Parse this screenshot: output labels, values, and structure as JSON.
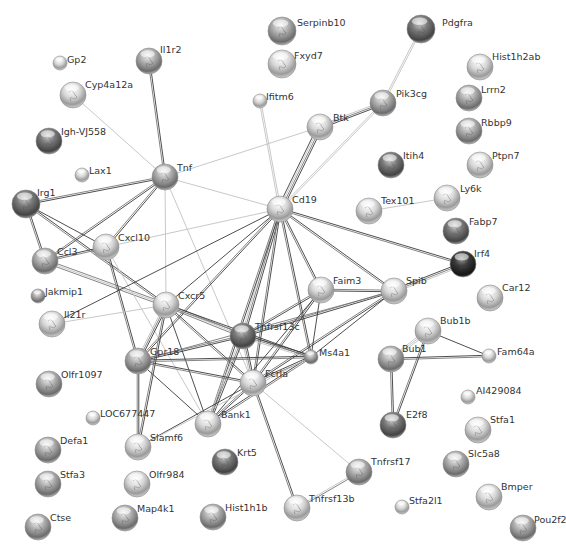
{
  "network": {
    "title": "Protein interaction network",
    "colors": {
      "background": "#ffffff",
      "edge_dark": "#3a3a3a",
      "edge_mid": "#777777",
      "edge_light": "#c2c2c2",
      "node_light": "#e4e4e4",
      "node_mid": "#a8a8a8",
      "node_dark": "#5a5a5a",
      "label": "#333333"
    },
    "nodes": [
      {
        "id": "Serpinb10",
        "label": "Serpinb10",
        "x": 282,
        "y": 31,
        "r": 14,
        "shade": "mid",
        "lx": 297,
        "ly": 22
      },
      {
        "id": "Fxyd7",
        "label": "Fxyd7",
        "x": 282,
        "y": 64,
        "r": 14,
        "shade": "light",
        "lx": 294,
        "ly": 55
      },
      {
        "id": "Pdgfra",
        "label": "Pdgfra",
        "x": 421,
        "y": 29,
        "r": 14,
        "shade": "dark",
        "lx": 442,
        "ly": 22
      },
      {
        "id": "Il1r2",
        "label": "Il1r2",
        "x": 149,
        "y": 61,
        "r": 13,
        "shade": "mid",
        "lx": 160,
        "ly": 49
      },
      {
        "id": "Gp2",
        "label": "Gp2",
        "x": 60,
        "y": 63,
        "r": 7,
        "shade": "light",
        "lx": 67,
        "ly": 59
      },
      {
        "id": "Cyp4a12a",
        "label": "Cyp4a12a",
        "x": 73,
        "y": 95,
        "r": 13,
        "shade": "light",
        "lx": 85,
        "ly": 84
      },
      {
        "id": "Ifitm6",
        "label": "Ifitm6",
        "x": 260,
        "y": 101,
        "r": 7,
        "shade": "light",
        "lx": 266,
        "ly": 96
      },
      {
        "id": "Hist1h2ab",
        "label": "Hist1h2ab",
        "x": 480,
        "y": 67,
        "r": 13,
        "shade": "light",
        "lx": 492,
        "ly": 56
      },
      {
        "id": "Lrrn2",
        "label": "Lrrn2",
        "x": 469,
        "y": 98,
        "r": 13,
        "shade": "mid",
        "lx": 481,
        "ly": 89
      },
      {
        "id": "Rbbp9",
        "label": "Rbbp9",
        "x": 469,
        "y": 131,
        "r": 13,
        "shade": "mid",
        "lx": 481,
        "ly": 122
      },
      {
        "id": "Ptpn7",
        "label": "Ptpn7",
        "x": 480,
        "y": 165,
        "r": 13,
        "shade": "light",
        "lx": 492,
        "ly": 155
      },
      {
        "id": "Pik3cg",
        "label": "Pik3cg",
        "x": 383,
        "y": 103,
        "r": 13,
        "shade": "mid",
        "lx": 396,
        "ly": 93
      },
      {
        "id": "Btk",
        "label": "Btk",
        "x": 320,
        "y": 127,
        "r": 13,
        "shade": "light",
        "lx": 333,
        "ly": 117
      },
      {
        "id": "Igh-VJ558",
        "label": "Igh-VJ558",
        "x": 49,
        "y": 141,
        "r": 13,
        "shade": "dark",
        "lx": 61,
        "ly": 131
      },
      {
        "id": "Lax1",
        "label": "Lax1",
        "x": 82,
        "y": 175,
        "r": 7,
        "shade": "light",
        "lx": 89,
        "ly": 170
      },
      {
        "id": "Tnf",
        "label": "Tnf",
        "x": 165,
        "y": 177,
        "r": 13,
        "shade": "mid",
        "lx": 177,
        "ly": 167
      },
      {
        "id": "Itih4",
        "label": "Itih4",
        "x": 391,
        "y": 165,
        "r": 13,
        "shade": "dark",
        "lx": 403,
        "ly": 155
      },
      {
        "id": "Irg1",
        "label": "Irg1",
        "x": 26,
        "y": 204,
        "r": 14,
        "shade": "dark",
        "lx": 37,
        "ly": 192
      },
      {
        "id": "Cd19",
        "label": "Cd19",
        "x": 280,
        "y": 209,
        "r": 13,
        "shade": "light",
        "lx": 292,
        "ly": 199
      },
      {
        "id": "Tex101",
        "label": "Tex101",
        "x": 369,
        "y": 211,
        "r": 13,
        "shade": "light",
        "lx": 381,
        "ly": 200
      },
      {
        "id": "Ly6k",
        "label": "Ly6k",
        "x": 447,
        "y": 198,
        "r": 13,
        "shade": "light",
        "lx": 460,
        "ly": 188
      },
      {
        "id": "Fabp7",
        "label": "Fabp7",
        "x": 456,
        "y": 231,
        "r": 13,
        "shade": "dark",
        "lx": 469,
        "ly": 221
      },
      {
        "id": "Irf4",
        "label": "Irf4",
        "x": 463,
        "y": 264,
        "r": 13,
        "shade": "black",
        "lx": 474,
        "ly": 253
      },
      {
        "id": "Cxcl10",
        "label": "Cxcl10",
        "x": 106,
        "y": 247,
        "r": 13,
        "shade": "light",
        "lx": 118,
        "ly": 237
      },
      {
        "id": "Ccl3",
        "label": "Ccl3",
        "x": 45,
        "y": 261,
        "r": 13,
        "shade": "mid",
        "lx": 57,
        "ly": 251
      },
      {
        "id": "Jakmip1",
        "label": "Jakmip1",
        "x": 38,
        "y": 296,
        "r": 7,
        "shade": "mid",
        "lx": 45,
        "ly": 291
      },
      {
        "id": "Faim3",
        "label": "Faim3",
        "x": 321,
        "y": 290,
        "r": 13,
        "shade": "light",
        "lx": 333,
        "ly": 280
      },
      {
        "id": "Spib",
        "label": "Spib",
        "x": 394,
        "y": 291,
        "r": 13,
        "shade": "light",
        "lx": 406,
        "ly": 280
      },
      {
        "id": "Car12",
        "label": "Car12",
        "x": 490,
        "y": 298,
        "r": 13,
        "shade": "light",
        "lx": 502,
        "ly": 287
      },
      {
        "id": "Cxcr5",
        "label": "Cxcr5",
        "x": 166,
        "y": 305,
        "r": 13,
        "shade": "light",
        "lx": 178,
        "ly": 295
      },
      {
        "id": "Il21r",
        "label": "Il21r",
        "x": 52,
        "y": 324,
        "r": 13,
        "shade": "light",
        "lx": 64,
        "ly": 314
      },
      {
        "id": "Tnfrsf13c",
        "label": "Tnfrsf13c",
        "x": 243,
        "y": 336,
        "r": 13,
        "shade": "dark",
        "lx": 255,
        "ly": 326
      },
      {
        "id": "Bub1b",
        "label": "Bub1b",
        "x": 428,
        "y": 331,
        "r": 13,
        "shade": "light",
        "lx": 440,
        "ly": 320
      },
      {
        "id": "Gpr18",
        "label": "Gpr18",
        "x": 138,
        "y": 361,
        "r": 13,
        "shade": "mid",
        "lx": 150,
        "ly": 351
      },
      {
        "id": "Ms4a1",
        "label": "Ms4a1",
        "x": 311,
        "y": 357,
        "r": 7,
        "shade": "mid",
        "lx": 319,
        "ly": 352
      },
      {
        "id": "Bub1",
        "label": "Bub1",
        "x": 391,
        "y": 359,
        "r": 13,
        "shade": "mid",
        "lx": 402,
        "ly": 348
      },
      {
        "id": "Fam64a",
        "label": "Fam64a",
        "x": 489,
        "y": 356,
        "r": 7,
        "shade": "light",
        "lx": 497,
        "ly": 351
      },
      {
        "id": "Fcrla",
        "label": "Fcrla",
        "x": 253,
        "y": 383,
        "r": 13,
        "shade": "light",
        "lx": 265,
        "ly": 373
      },
      {
        "id": "Olfr1097",
        "label": "Olfr1097",
        "x": 49,
        "y": 384,
        "r": 13,
        "shade": "mid",
        "lx": 61,
        "ly": 374
      },
      {
        "id": "AI429084",
        "label": "AI429084",
        "x": 468,
        "y": 397,
        "r": 7,
        "shade": "light",
        "lx": 476,
        "ly": 390
      },
      {
        "id": "LOC677447",
        "label": "LOC677447",
        "x": 93,
        "y": 418,
        "r": 7,
        "shade": "light",
        "lx": 100,
        "ly": 413
      },
      {
        "id": "Bank1",
        "label": "Bank1",
        "x": 208,
        "y": 424,
        "r": 13,
        "shade": "light",
        "lx": 221,
        "ly": 414
      },
      {
        "id": "E2f8",
        "label": "E2f8",
        "x": 393,
        "y": 425,
        "r": 13,
        "shade": "dark",
        "lx": 406,
        "ly": 414
      },
      {
        "id": "Stfa1",
        "label": "Stfa1",
        "x": 478,
        "y": 430,
        "r": 13,
        "shade": "light",
        "lx": 490,
        "ly": 419
      },
      {
        "id": "Defa1",
        "label": "Defa1",
        "x": 48,
        "y": 450,
        "r": 13,
        "shade": "mid",
        "lx": 60,
        "ly": 440
      },
      {
        "id": "Slamf6",
        "label": "Slamf6",
        "x": 138,
        "y": 447,
        "r": 13,
        "shade": "light",
        "lx": 150,
        "ly": 437
      },
      {
        "id": "Slc5a8",
        "label": "Slc5a8",
        "x": 456,
        "y": 464,
        "r": 13,
        "shade": "mid",
        "lx": 468,
        "ly": 453
      },
      {
        "id": "Tnfrsf17",
        "label": "Tnfrsf17",
        "x": 359,
        "y": 472,
        "r": 13,
        "shade": "mid",
        "lx": 371,
        "ly": 461
      },
      {
        "id": "Krt5",
        "label": "Krt5",
        "x": 225,
        "y": 462,
        "r": 13,
        "shade": "dark",
        "lx": 237,
        "ly": 452
      },
      {
        "id": "Stfa3",
        "label": "Stfa3",
        "x": 48,
        "y": 484,
        "r": 13,
        "shade": "mid",
        "lx": 60,
        "ly": 474
      },
      {
        "id": "Olfr984",
        "label": "Olfr984",
        "x": 137,
        "y": 484,
        "r": 13,
        "shade": "light",
        "lx": 149,
        "ly": 474
      },
      {
        "id": "Bmper",
        "label": "Bmper",
        "x": 489,
        "y": 497,
        "r": 13,
        "shade": "light",
        "lx": 501,
        "ly": 486
      },
      {
        "id": "Tnfrsf13b",
        "label": "Tnfrsf13b",
        "x": 297,
        "y": 508,
        "r": 13,
        "shade": "light",
        "lx": 309,
        "ly": 498
      },
      {
        "id": "Stfa2l1",
        "label": "Stfa2l1",
        "x": 402,
        "y": 507,
        "r": 7,
        "shade": "light",
        "lx": 409,
        "ly": 500
      },
      {
        "id": "Map4k1",
        "label": "Map4k1",
        "x": 125,
        "y": 518,
        "r": 13,
        "shade": "mid",
        "lx": 137,
        "ly": 508
      },
      {
        "id": "Hist1h1b",
        "label": "Hist1h1b",
        "x": 213,
        "y": 517,
        "r": 13,
        "shade": "mid",
        "lx": 225,
        "ly": 507
      },
      {
        "id": "Ctse",
        "label": "Ctse",
        "x": 38,
        "y": 527,
        "r": 13,
        "shade": "mid",
        "lx": 50,
        "ly": 517
      },
      {
        "id": "Pou2f2",
        "label": "Pou2f2",
        "x": 523,
        "y": 528,
        "r": 13,
        "shade": "mid",
        "lx": 534,
        "ly": 519
      }
    ],
    "edges": [
      [
        "Pdgfra",
        "Pik3cg",
        "light",
        2
      ],
      [
        "Pik3cg",
        "Btk",
        "dark",
        3
      ],
      [
        "Pik3cg",
        "Cd19",
        "light",
        2
      ],
      [
        "Btk",
        "Cd19",
        "dark",
        4
      ],
      [
        "Btk",
        "Tnf",
        "light",
        1
      ],
      [
        "Il1r2",
        "Tnf",
        "dark",
        2
      ],
      [
        "Cyp4a12a",
        "Tnf",
        "light",
        1
      ],
      [
        "Ifitm6",
        "Cd19",
        "light",
        2
      ],
      [
        "Tnf",
        "Irg1",
        "dark",
        2
      ],
      [
        "Tnf",
        "Cxcl10",
        "dark",
        2
      ],
      [
        "Tnf",
        "Ccl3",
        "dark",
        2
      ],
      [
        "Tnf",
        "Cd19",
        "light",
        1
      ],
      [
        "Tnf",
        "Cxcr5",
        "light",
        1
      ],
      [
        "Tnf",
        "Fcrla",
        "light",
        1
      ],
      [
        "Irg1",
        "Ccl3",
        "dark",
        2
      ],
      [
        "Irg1",
        "Cxcl10",
        "dark",
        1
      ],
      [
        "Irg1",
        "Cxcr5",
        "dark",
        2
      ],
      [
        "Ccl3",
        "Cxcl10",
        "dark",
        2
      ],
      [
        "Ccl3",
        "Cxcr5",
        "mid",
        3
      ],
      [
        "Cxcl10",
        "Cd19",
        "light",
        1
      ],
      [
        "Cxcl10",
        "Gpr18",
        "dark",
        2
      ],
      [
        "Cxcl10",
        "Bank1",
        "light",
        1
      ],
      [
        "Il21r",
        "Cd19",
        "dark",
        1
      ],
      [
        "Il21r",
        "Cxcr5",
        "light",
        1
      ],
      [
        "Cd19",
        "Cxcr5",
        "dark",
        1
      ],
      [
        "Cd19",
        "Tnfrsf13c",
        "dark",
        3
      ],
      [
        "Cd19",
        "Faim3",
        "dark",
        2
      ],
      [
        "Cd19",
        "Spib",
        "dark",
        2
      ],
      [
        "Cd19",
        "Irf4",
        "dark",
        2
      ],
      [
        "Cd19",
        "Fcrla",
        "dark",
        2
      ],
      [
        "Cd19",
        "Ms4a1",
        "dark",
        2
      ],
      [
        "Cd19",
        "Gpr18",
        "dark",
        2
      ],
      [
        "Cd19",
        "Bank1",
        "dark",
        2
      ],
      [
        "Tex101",
        "Ly6k",
        "light",
        1
      ],
      [
        "Spib",
        "Irf4",
        "dark",
        3
      ],
      [
        "Spib",
        "Faim3",
        "dark",
        2
      ],
      [
        "Spib",
        "Tnfrsf13c",
        "dark",
        2
      ],
      [
        "Spib",
        "Fcrla",
        "dark",
        2
      ],
      [
        "Spib",
        "Gpr18",
        "mid",
        1
      ],
      [
        "Spib",
        "Ms4a1",
        "dark",
        1
      ],
      [
        "Faim3",
        "Tnfrsf13c",
        "dark",
        2
      ],
      [
        "Faim3",
        "Fcrla",
        "dark",
        2
      ],
      [
        "Faim3",
        "Ms4a1",
        "dark",
        1
      ],
      [
        "Faim3",
        "Bank1",
        "dark",
        1
      ],
      [
        "Cxcr5",
        "Tnfrsf13c",
        "mid",
        3
      ],
      [
        "Cxcr5",
        "Gpr18",
        "dark",
        3
      ],
      [
        "Cxcr5",
        "Fcrla",
        "dark",
        2
      ],
      [
        "Cxcr5",
        "Bank1",
        "dark",
        1
      ],
      [
        "Cxcr5",
        "Slamf6",
        "dark",
        2
      ],
      [
        "Cxcr5",
        "Ms4a1",
        "dark",
        2
      ],
      [
        "Tnfrsf13c",
        "Gpr18",
        "dark",
        2
      ],
      [
        "Tnfrsf13c",
        "Fcrla",
        "dark",
        3
      ],
      [
        "Tnfrsf13c",
        "Ms4a1",
        "dark",
        3
      ],
      [
        "Tnfrsf13c",
        "Bank1",
        "dark",
        3
      ],
      [
        "Gpr18",
        "Fcrla",
        "dark",
        2
      ],
      [
        "Gpr18",
        "Ms4a1",
        "dark",
        2
      ],
      [
        "Gpr18",
        "Bank1",
        "dark",
        1
      ],
      [
        "Gpr18",
        "Slamf6",
        "dark",
        2
      ],
      [
        "Fcrla",
        "Ms4a1",
        "dark",
        2
      ],
      [
        "Fcrla",
        "Bank1",
        "dark",
        2
      ],
      [
        "Fcrla",
        "Slamf6",
        "dark",
        1
      ],
      [
        "Fcrla",
        "Tnfrsf13b",
        "dark",
        2
      ],
      [
        "Fcrla",
        "Tnfrsf17",
        "light",
        1
      ],
      [
        "Bank1",
        "Ms4a1",
        "dark",
        2
      ],
      [
        "Slamf6",
        "Ms4a1",
        "light",
        1
      ],
      [
        "Tnfrsf17",
        "Tnfrsf13b",
        "mid",
        2
      ],
      [
        "Bub1b",
        "Bub1",
        "light",
        3
      ],
      [
        "Bub1b",
        "Fam64a",
        "dark",
        1
      ],
      [
        "Bub1b",
        "E2f8",
        "dark",
        2
      ],
      [
        "Bub1",
        "Fam64a",
        "dark",
        2
      ],
      [
        "Bub1",
        "E2f8",
        "dark",
        2
      ]
    ]
  }
}
